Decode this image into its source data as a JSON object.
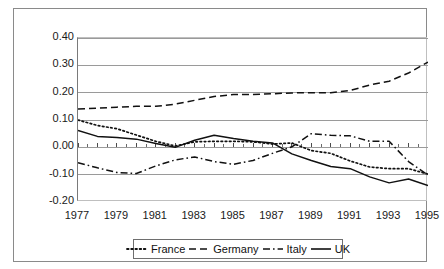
{
  "chart_data": {
    "type": "line",
    "title": "",
    "subtitle": "",
    "xlabel": "",
    "ylabel": "",
    "xlim": [
      1977,
      1995
    ],
    "ylim": [
      -0.2,
      0.4
    ],
    "grid": true,
    "legend_position": "bottom",
    "x": [
      1977,
      1978,
      1979,
      1980,
      1981,
      1982,
      1983,
      1984,
      1985,
      1986,
      1987,
      1988,
      1989,
      1990,
      1991,
      1992,
      1993,
      1994,
      1995
    ],
    "x_tick_labels": [
      "1977",
      "1979",
      "1981",
      "1983",
      "1985",
      "1987",
      "1989",
      "1991",
      "1993",
      "1995"
    ],
    "y_tick_labels": [
      "0.40",
      "0.30",
      "0.20",
      "0.10",
      "0.00",
      "-0.10",
      "-0.20"
    ],
    "y_ticks": [
      0.4,
      0.3,
      0.2,
      0.1,
      0.0,
      -0.1,
      -0.2
    ],
    "series": [
      {
        "name": "France",
        "style": "dotted",
        "color": "#111111",
        "values": [
          0.1,
          0.08,
          0.068,
          0.045,
          0.022,
          0.005,
          0.02,
          0.022,
          0.022,
          0.02,
          0.012,
          0.016,
          -0.012,
          -0.022,
          -0.05,
          -0.072,
          -0.078,
          -0.078,
          -0.098
        ]
      },
      {
        "name": "Germany",
        "style": "dashed",
        "color": "#111111",
        "values": [
          0.14,
          0.143,
          0.147,
          0.15,
          0.15,
          0.158,
          0.172,
          0.186,
          0.193,
          0.193,
          0.196,
          0.199,
          0.2,
          0.2,
          0.208,
          0.228,
          0.242,
          0.272,
          0.312
        ]
      },
      {
        "name": "Italy",
        "style": "dash-dot",
        "color": "#111111",
        "values": [
          -0.056,
          -0.075,
          -0.092,
          -0.096,
          -0.068,
          -0.046,
          -0.035,
          -0.052,
          -0.062,
          -0.048,
          -0.022,
          0.002,
          0.05,
          0.044,
          0.042,
          0.022,
          0.022,
          -0.052,
          -0.102
        ]
      },
      {
        "name": "UK",
        "style": "solid",
        "color": "#111111",
        "values": [
          0.062,
          0.04,
          0.036,
          0.03,
          0.014,
          0.0,
          0.026,
          0.044,
          0.032,
          0.022,
          0.016,
          -0.024,
          -0.048,
          -0.07,
          -0.078,
          -0.108,
          -0.13,
          -0.116,
          -0.14
        ]
      }
    ]
  },
  "legend": {
    "items": [
      {
        "label": "France",
        "swatch": "dotted-line-swatch"
      },
      {
        "label": "Germany",
        "swatch": "dashed-line-swatch"
      },
      {
        "label": "Italy",
        "swatch": "dash-dot-line-swatch"
      },
      {
        "label": "UK",
        "swatch": "solid-line-swatch"
      }
    ]
  }
}
